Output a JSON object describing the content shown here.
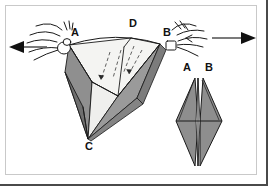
{
  "figure": {
    "name": "paper-folding-instruction-diagram",
    "background_color": "#ffffff",
    "frame_border_color": "#c9c9c9",
    "shadow_border_color": "#4a4a4a",
    "ink_color": "#111111"
  },
  "colors": {
    "light_face": "#f4f4f2",
    "mid_gray_face": "#9a9a9a",
    "dark_gray_face": "#6f6f6f",
    "diamond_face": "#8e8e8e",
    "diamond_face_dark": "#777777",
    "outline": "#1a1a1a",
    "fold_line": "#3a3a3a",
    "arrow": "#555555"
  },
  "left_figure": {
    "name": "pull-apart-step",
    "labels": [
      {
        "id": "A",
        "text": "A",
        "x": 75,
        "y": 36
      },
      {
        "id": "D",
        "text": "D",
        "x": 133,
        "y": 27
      },
      {
        "id": "B",
        "text": "B",
        "x": 167,
        "y": 36
      },
      {
        "id": "C",
        "text": "C",
        "x": 89,
        "y": 147
      }
    ],
    "hands": [
      {
        "id": "left-hand",
        "grips": "A",
        "side": "left"
      },
      {
        "id": "right-hand",
        "grips": "B",
        "side": "right"
      }
    ]
  },
  "right_figure": {
    "name": "flattened-diamond-result",
    "labels": [
      {
        "id": "A",
        "text": "A",
        "x": 187,
        "y": 71
      },
      {
        "id": "B",
        "text": "B",
        "x": 208,
        "y": 71
      }
    ]
  },
  "arrows": [
    {
      "id": "left-pull-arrow",
      "direction": "left",
      "label": ""
    },
    {
      "id": "right-pull-arrow",
      "direction": "right",
      "label": ""
    }
  ]
}
